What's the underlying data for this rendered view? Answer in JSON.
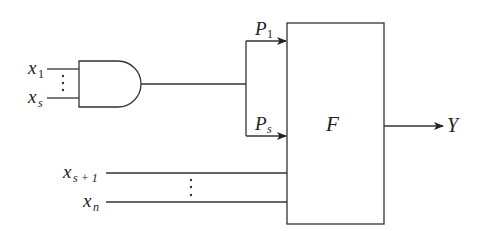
{
  "diagram": {
    "type": "logic-circuit",
    "gate": {
      "kind": "AND",
      "inputs": [
        "x_1",
        "x_s"
      ]
    },
    "inputs_gate": [
      {
        "base": "x",
        "sub": "1"
      },
      {
        "base": "x",
        "sub": "s"
      }
    ],
    "inputs_direct": [
      {
        "base": "x",
        "sub": "s + 1"
      },
      {
        "base": "x",
        "sub": "n"
      }
    ],
    "branches": [
      {
        "base": "P",
        "sub": "1"
      },
      {
        "base": "P",
        "sub": "s"
      }
    ],
    "block": {
      "label": "F"
    },
    "output": {
      "label": "Y"
    },
    "ellipsis": "⋮",
    "colors": {
      "line": "#333333",
      "text": "#222222",
      "background": "#ffffff"
    }
  }
}
